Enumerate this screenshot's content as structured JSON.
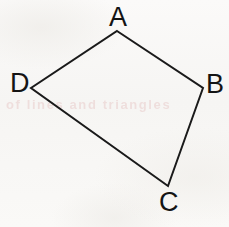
{
  "figure": {
    "shape_type": "quadrilateral",
    "background_color": "#f8f7f5",
    "stroke_color": "#1a1a1a",
    "stroke_width": 2,
    "canvas": {
      "width": 229,
      "height": 227
    },
    "vertices": [
      {
        "name": "A",
        "label": "A",
        "x": 117,
        "y": 31,
        "label_position": "above"
      },
      {
        "name": "B",
        "label": "B",
        "x": 203,
        "y": 88,
        "label_position": "right"
      },
      {
        "name": "C",
        "label": "C",
        "x": 168,
        "y": 186,
        "label_position": "below"
      },
      {
        "name": "D",
        "label": "D",
        "x": 31,
        "y": 88,
        "label_position": "left"
      }
    ],
    "edges": [
      {
        "name": "edge-AB",
        "from": "A",
        "to": "B"
      },
      {
        "name": "edge-BC",
        "from": "B",
        "to": "C"
      },
      {
        "name": "edge-CD",
        "from": "C",
        "to": "D"
      },
      {
        "name": "edge-DA",
        "from": "D",
        "to": "A"
      }
    ],
    "polygon_points": "117,31 203,88 168,186 31,88",
    "artifact": {
      "name": "reverse-side-bleed-through",
      "color": "#c8696b",
      "text": "of lines and triangles"
    }
  }
}
